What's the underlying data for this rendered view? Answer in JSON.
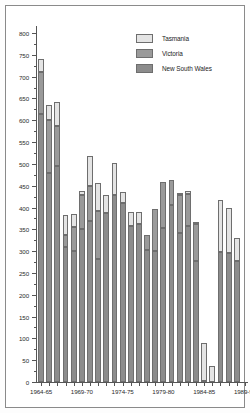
{
  "chart_data": {
    "type": "bar",
    "subtype": "stacked-vertical",
    "title": "",
    "subtitle": "",
    "xlabel": "",
    "ylabel": "",
    "ylim": [
      0,
      800
    ],
    "ytick_step": 50,
    "yticks": [
      0,
      50,
      100,
      150,
      200,
      250,
      300,
      350,
      400,
      450,
      500,
      550,
      600,
      650,
      700,
      750,
      800
    ],
    "ytick_labels": [
      "0",
      "50",
      "100",
      "150",
      "200",
      "250",
      "300",
      "350",
      "400",
      "450",
      "500",
      "550",
      "600",
      "650",
      "700",
      "750",
      "800"
    ],
    "grid": false,
    "legend_position": "top-right",
    "categories": [
      "1964-65",
      "1965-66",
      "1966-67",
      "1967-68",
      "1968-69",
      "1969-70",
      "1970-71",
      "1971-72",
      "1972-73",
      "1973-74",
      "1974-75",
      "1975-76",
      "1976-77",
      "1977-78",
      "1978-79",
      "1979-80",
      "1980-81",
      "1981-82",
      "1982-83",
      "1983-84",
      "1984-85",
      "1985-86",
      "1986-87",
      "1987-88",
      "1988-89",
      "1989-90"
    ],
    "xtick_labels": [
      "1964-65",
      "1969-70",
      "1974-75",
      "1979-80",
      "1984-85",
      "1989-90"
    ],
    "xtick_label_indices": [
      0,
      5,
      10,
      15,
      20,
      25
    ],
    "series": [
      {
        "name": "New South Wales",
        "color": "#8c8c8c",
        "values": [
          615,
          480,
          495,
          310,
          300,
          350,
          370,
          283,
          388,
          429,
          411,
          358,
          362,
          302,
          301,
          352,
          406,
          341,
          358,
          277,
          3,
          0,
          297,
          296,
          278,
          0
        ]
      },
      {
        "name": "Victoria",
        "color": "#9a9a9a",
        "values": [
          96,
          120,
          93,
          28,
          55,
          79,
          79,
          110,
          0,
          0,
          0,
          0,
          0,
          36,
          96,
          106,
          57,
          88,
          72,
          85,
          0,
          0,
          0,
          0,
          0,
          0
        ]
      },
      {
        "name": "Tasmania",
        "color": "#e4e4e4",
        "values": [
          30,
          35,
          55,
          46,
          30,
          10,
          70,
          63,
          40,
          72,
          24,
          32,
          28,
          0,
          0,
          0,
          0,
          5,
          9,
          4,
          86,
          37,
          121,
          103,
          53,
          0
        ]
      }
    ],
    "stack_totals": [
      741,
      635,
      643,
      384,
      385,
      439,
      519,
      456,
      428,
      501,
      435,
      390,
      390,
      338,
      397,
      458,
      463,
      434,
      439,
      366,
      89,
      37,
      418,
      399,
      331,
      0
    ]
  },
  "legend": {
    "items": [
      {
        "label": "Tasmania",
        "color": "#e4e4e4"
      },
      {
        "label": "Victoria",
        "color": "#9a9a9a"
      },
      {
        "label": "New South Wales",
        "color": "#8c8c8c"
      }
    ]
  },
  "colors": {
    "tasmania": "#e4e4e4",
    "victoria": "#9a9a9a",
    "new_south_wales": "#8c8c8c",
    "axis": "#555555",
    "frame": "#8a8a8a",
    "text": "#2b2b2b",
    "background": "#ffffff"
  }
}
